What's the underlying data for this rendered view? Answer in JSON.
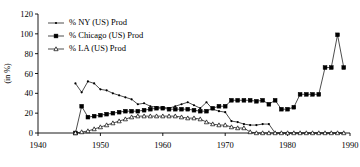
{
  "chart_data": {
    "type": "line",
    "title": "",
    "subtitle": "",
    "xlabel": "",
    "ylabel": "(in %)",
    "xlim": [
      1940,
      1990
    ],
    "ylim": [
      0,
      120
    ],
    "xticks": [
      1940,
      1950,
      1960,
      1970,
      1980,
      1990
    ],
    "xtick_labels": [
      "1940",
      "1950",
      "1960",
      "1970",
      "1980",
      "1990"
    ],
    "yticks": [
      0,
      20,
      40,
      60,
      80,
      100,
      120
    ],
    "ytick_labels": [
      "0",
      "20",
      "40",
      "60",
      "80",
      "100",
      "120"
    ],
    "grid": false,
    "legend_position": "top-left",
    "series": [
      {
        "name": "% NY (US) Prod",
        "marker": "dot",
        "x": [
          1946,
          1947,
          1948,
          1949,
          1950,
          1951,
          1952,
          1953,
          1954,
          1955,
          1956,
          1957,
          1958,
          1959,
          1960,
          1961,
          1962,
          1963,
          1964,
          1965,
          1966,
          1967,
          1968,
          1969,
          1970,
          1971,
          1972,
          1973,
          1974,
          1975,
          1976,
          1977,
          1978,
          1979,
          1980,
          1981,
          1982,
          1983,
          1984,
          1985,
          1986,
          1987,
          1988,
          1989
        ],
        "values": [
          50,
          41,
          52,
          50,
          44,
          43,
          40,
          38,
          36,
          34,
          29,
          30,
          27,
          26,
          26,
          25,
          27,
          29,
          31,
          28,
          25,
          31,
          24,
          22,
          21,
          12,
          11,
          9,
          8,
          8,
          9,
          9,
          0,
          0,
          0,
          0,
          0,
          0,
          0,
          0,
          0,
          0,
          0,
          0
        ]
      },
      {
        "name": "% Chicago (US) Prod",
        "marker": "square",
        "x": [
          1946,
          1947,
          1948,
          1949,
          1950,
          1951,
          1952,
          1953,
          1954,
          1955,
          1956,
          1957,
          1958,
          1959,
          1960,
          1961,
          1962,
          1963,
          1964,
          1965,
          1966,
          1967,
          1968,
          1969,
          1970,
          1971,
          1972,
          1973,
          1974,
          1975,
          1976,
          1977,
          1978,
          1979,
          1980,
          1981,
          1982,
          1983,
          1984,
          1985,
          1986,
          1987,
          1988,
          1989
        ],
        "values": [
          0,
          27,
          16,
          17,
          18,
          19,
          20,
          21,
          22,
          22,
          22,
          23,
          24,
          25,
          25,
          24,
          24,
          24,
          24,
          23,
          22,
          22,
          25,
          27,
          27,
          33,
          33,
          33,
          33,
          32,
          33,
          29,
          33,
          24,
          24,
          26,
          39,
          39,
          39,
          39,
          66,
          66,
          99,
          66
        ]
      },
      {
        "name": "% LA (US) Prod",
        "marker": "triangle",
        "x": [
          1946,
          1947,
          1948,
          1949,
          1950,
          1951,
          1952,
          1953,
          1954,
          1955,
          1956,
          1957,
          1958,
          1959,
          1960,
          1961,
          1962,
          1963,
          1964,
          1965,
          1966,
          1967,
          1968,
          1969,
          1970,
          1971,
          1972,
          1973,
          1974,
          1975,
          1976,
          1977,
          1978,
          1979,
          1980,
          1981,
          1982,
          1983,
          1984,
          1985,
          1986,
          1987,
          1988,
          1989
        ],
        "values": [
          0,
          1,
          2,
          4,
          6,
          8,
          10,
          12,
          14,
          16,
          17,
          17,
          17,
          17,
          17,
          17,
          17,
          16,
          15,
          15,
          14,
          11,
          9,
          8,
          8,
          6,
          5,
          5,
          1,
          0,
          0,
          0,
          0,
          0,
          0,
          0,
          0,
          0,
          0,
          0,
          0,
          0,
          0,
          0
        ]
      }
    ]
  }
}
